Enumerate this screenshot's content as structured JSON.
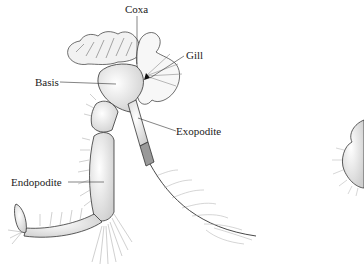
{
  "figure": {
    "labels": {
      "coxa": "Coxa",
      "gill": "Gill",
      "basis": "Basis",
      "exopodite": "Exopodite",
      "endopodite": "Endopodite"
    }
  },
  "colors": {
    "ink": "#222222",
    "shade": "#bdbdbd",
    "background": "#ffffff"
  }
}
